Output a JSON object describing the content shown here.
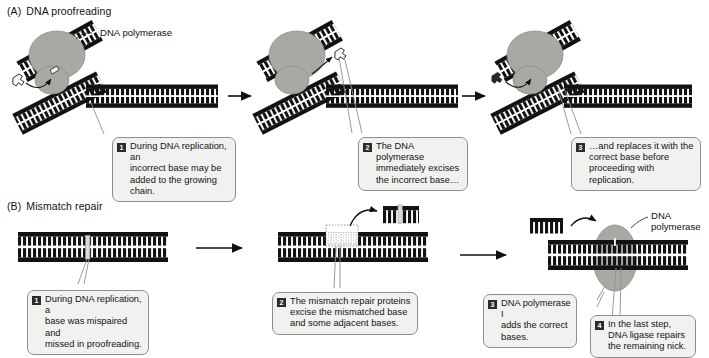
{
  "figure": {
    "title_a_tag": "(A)",
    "title_a_text": "DNA proofreading",
    "title_b_tag": "(B)",
    "title_b_text": "Mismatch repair",
    "colors": {
      "dna_black": "#121212",
      "enzyme_gray": "#a9a9a4",
      "enzyme_gray_dark": "#9a9a94",
      "callout_fill": "#f1f1ef",
      "callout_border": "#8e8e8a",
      "badge_fill": "#2b2b2b",
      "badge_text": "#ffffff",
      "leader_line": "#8e8e8a",
      "arrow": "#111111"
    }
  },
  "panel_a": {
    "label_polymerase": "DNA polymerase",
    "steps": [
      {
        "num": "1",
        "text": "During DNA replication, an\nincorrect base may be\nadded to the growing chain."
      },
      {
        "num": "2",
        "text": "The DNA polymerase\nimmediately excises\nthe incorrect base…"
      },
      {
        "num": "3",
        "text": "…and replaces it with the\ncorrect base before\nproceeding with replication."
      }
    ]
  },
  "panel_b": {
    "label_polymerase": "DNA\npolymerase",
    "steps": [
      {
        "num": "1",
        "text": "During DNA replication, a\nbase was mispaired and\nmissed in proofreading."
      },
      {
        "num": "2",
        "text": "The mismatch repair proteins\nexcise the mismatched base\nand some adjacent bases."
      },
      {
        "num": "3",
        "text": "DNA polymerase I\nadds the correct\nbases."
      },
      {
        "num": "4",
        "text": "In the last step,\nDNA ligase repairs\nthe remaining nick."
      }
    ]
  }
}
